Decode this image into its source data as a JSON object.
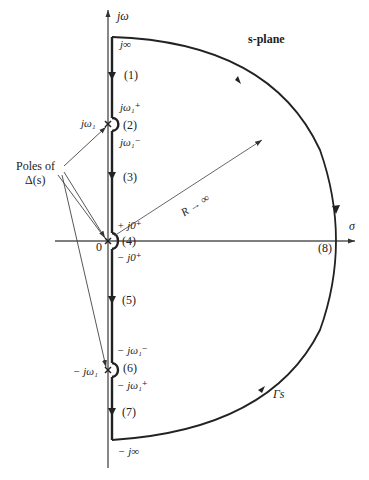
{
  "diagram": {
    "title": "s-plane",
    "axes": {
      "vertical_label": "jω",
      "horizontal_label": "σ",
      "origin_label": "0"
    },
    "contour": {
      "name": "Γs",
      "radius_label": "R → ∞",
      "top_label": "j∞",
      "bottom_label": "− j∞"
    },
    "segments": [
      {
        "id": "1",
        "label": "(1)"
      },
      {
        "id": "2",
        "label": "(2)"
      },
      {
        "id": "3",
        "label": "(3)"
      },
      {
        "id": "4",
        "label": "(4)"
      },
      {
        "id": "5",
        "label": "(5)"
      },
      {
        "id": "6",
        "label": "(6)"
      },
      {
        "id": "7",
        "label": "(7)"
      },
      {
        "id": "8",
        "label": "(8)"
      }
    ],
    "point_labels": {
      "jw1_plus": "jω₁⁺",
      "jw1": "jω₁",
      "jw1_minus": "jω₁⁻",
      "j0_plus": "+ j0⁺",
      "neg_j0_plus": "− j0⁺",
      "neg_jw1_minus": "− jω₁⁻",
      "neg_jw1": "− jω₁",
      "neg_jw1_plus": "− jω₁⁺"
    },
    "annotation": {
      "line1": "Poles of",
      "line2": "Δ(s)"
    }
  }
}
